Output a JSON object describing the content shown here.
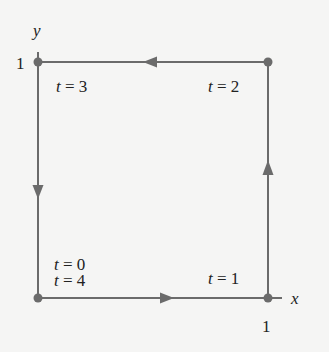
{
  "diagram": {
    "axes": {
      "x_label": "x",
      "y_label": "y",
      "x_tick": "1",
      "y_tick": "1"
    },
    "path": {
      "color": "#6b6b6b",
      "vertices": [
        {
          "id": "origin",
          "point": [
            0,
            0
          ],
          "label": "t = 0",
          "label2": "t = 4"
        },
        {
          "id": "bottom-right",
          "point": [
            1,
            0
          ],
          "label": "t = 1"
        },
        {
          "id": "top-right",
          "point": [
            1,
            1
          ],
          "label": "t = 2"
        },
        {
          "id": "top-left",
          "point": [
            0,
            1
          ],
          "label": "t = 3"
        }
      ],
      "direction": "counterclockwise"
    }
  }
}
